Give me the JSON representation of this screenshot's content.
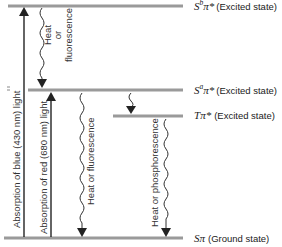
{
  "diagram": {
    "levels": [
      {
        "id": "sb",
        "symbol": "S",
        "superscript": "b",
        "orbital": "π*",
        "state": "(Excited state)"
      },
      {
        "id": "sa",
        "symbol": "S",
        "superscript": "a",
        "orbital": "π*",
        "state": "(Excited state)"
      },
      {
        "id": "t",
        "symbol": "T",
        "superscript": "",
        "orbital": "π*",
        "state": "(Excited state)"
      },
      {
        "id": "s0",
        "symbol": "S",
        "superscript": "",
        "orbital": "π",
        "state": "(Ground state)"
      }
    ],
    "transitions": [
      {
        "id": "abs-blue",
        "label": "Absorption of blue (430 nm) light",
        "from": "s0",
        "to": "sb",
        "kind": "absorption"
      },
      {
        "id": "abs-red",
        "label": "Absorption of red (680 nm) light",
        "from": "s0",
        "to": "sa",
        "kind": "absorption"
      },
      {
        "id": "decay-sb-sa",
        "label_lines": [
          "Heat",
          "or",
          "fluorescence"
        ],
        "from": "sb",
        "to": "sa",
        "kind": "emission"
      },
      {
        "id": "decay-sa-s0",
        "label": "Heat or fluorescence",
        "from": "sa",
        "to": "s0",
        "kind": "emission"
      },
      {
        "id": "decay-sa-t",
        "label": "",
        "from": "sa",
        "to": "t",
        "kind": "intersystem"
      },
      {
        "id": "decay-t-s0",
        "label": "Heat or phosphorescence",
        "from": "t",
        "to": "s0",
        "kind": "emission"
      }
    ],
    "colors": {
      "level_line": "#9a9a9a",
      "arrow": "#111111"
    }
  }
}
